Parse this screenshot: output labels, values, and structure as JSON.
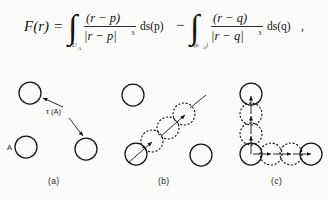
{
  "figure": {
    "background_color": "#fbfbfa",
    "ink_color": "#141414",
    "formula": {
      "lhs": "F(r)",
      "equals": "=",
      "minus": "−",
      "integral_glyph": "∫",
      "term1": {
        "subscript": "U",
        "subscript_sub": "A",
        "numerator": "(r − p)",
        "denominator": "|r − p|",
        "denominator_exponent": "3",
        "measure": "ds(p)"
      },
      "term2": {
        "subscript": "τ(u",
        "subscript_sub": "A",
        "subscript_close": ")",
        "numerator": "(r − q)",
        "denominator": "|r − q|",
        "denominator_exponent": "3",
        "measure": "ds(q)",
        "trailing_comma": ","
      }
    },
    "panels": [
      {
        "id": "a",
        "label": "(a)",
        "set_label": "A",
        "map_label": "τ (A)",
        "description": "three circles with two arrows from tau-of-A label"
      },
      {
        "id": "b",
        "label": "(b)",
        "description": "diagonal chain of dashed circles between solid circles with arrow"
      },
      {
        "id": "c",
        "label": "(c)",
        "description": "L-shaped chain of dashed circles with arrows, solid endpoints"
      }
    ]
  }
}
